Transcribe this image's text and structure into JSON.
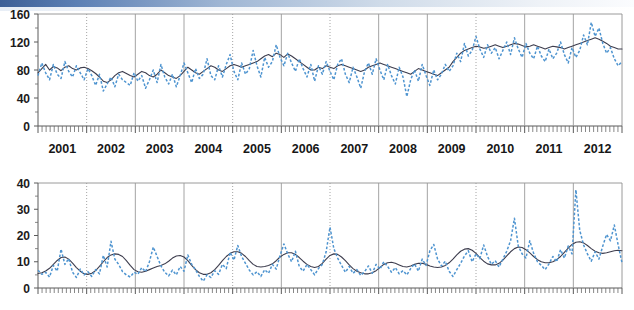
{
  "figure": {
    "title": "",
    "background_color": "#ffffff",
    "panels": 2
  },
  "style": {
    "series_a_color": "#3d3d4e",
    "series_b_color": "#4e94d0",
    "grid_color": "#9a9a9a",
    "axis_color": "#5a5a5a",
    "accent_band": "#3d5f96"
  },
  "chart_data": [
    {
      "type": "line",
      "panel": "top",
      "title": "",
      "xlabel": "",
      "ylabel": "",
      "xlim": [
        2000.5,
        2012.5
      ],
      "ylim": [
        0,
        160
      ],
      "yticks": [
        0,
        40,
        80,
        120,
        160
      ],
      "ytick_labels": [
        "0",
        "40",
        "80",
        "120",
        "160"
      ],
      "xticks": [
        2001,
        2002,
        2003,
        2004,
        2005,
        2006,
        2007,
        2008,
        2009,
        2010,
        2011,
        2012
      ],
      "xtick_labels": [
        "2001",
        "2002",
        "2003",
        "2004",
        "2005",
        "2006",
        "2007",
        "2008",
        "2009",
        "2010",
        "2011",
        "2012"
      ],
      "minor_ticks_per_year": 12,
      "grid": {
        "vertical": true,
        "horizontal": false,
        "dotted_years": [
          2002,
          2005,
          2007,
          2010
        ]
      },
      "legend": {
        "visible": false,
        "position": "none"
      },
      "series": [
        {
          "name": "smoothed",
          "style": "solid",
          "color": "#3d3d4e",
          "values": [
            76,
            82,
            88,
            80,
            85,
            83,
            79,
            84,
            86,
            82,
            80,
            83,
            84,
            82,
            79,
            75,
            70,
            64,
            62,
            66,
            72,
            76,
            78,
            75,
            72,
            70,
            74,
            78,
            76,
            72,
            70,
            74,
            80,
            76,
            72,
            70,
            68,
            72,
            78,
            84,
            80,
            76,
            74,
            78,
            82,
            86,
            84,
            80,
            78,
            82,
            86,
            88,
            86,
            84,
            86,
            88,
            90,
            92,
            96,
            100,
            102,
            99,
            104,
            102,
            98,
            103,
            100,
            96,
            92,
            88,
            84,
            80,
            80,
            84,
            82,
            86,
            84,
            82,
            86,
            88,
            86,
            84,
            82,
            80,
            78,
            80,
            84,
            86,
            88,
            90,
            88,
            86,
            84,
            82,
            80,
            78,
            76,
            74,
            78,
            82,
            80,
            78,
            76,
            74,
            72,
            76,
            80,
            84,
            92,
            98,
            104,
            108,
            110,
            112,
            114,
            113,
            111,
            112,
            114,
            116,
            114,
            112,
            114,
            116,
            118,
            117,
            115,
            113,
            114,
            116,
            114,
            112,
            110,
            112,
            114,
            113,
            112,
            110,
            112,
            114,
            116,
            118,
            120,
            122,
            124,
            126,
            124,
            121,
            118,
            114,
            112,
            110,
            110
          ]
        },
        {
          "name": "observed",
          "style": "dashed",
          "color": "#4e94d0",
          "values": [
            72,
            90,
            76,
            66,
            88,
            74,
            68,
            92,
            78,
            70,
            86,
            76,
            66,
            82,
            72,
            58,
            74,
            50,
            60,
            70,
            56,
            74,
            66,
            62,
            58,
            76,
            64,
            72,
            54,
            66,
            80,
            62,
            88,
            70,
            60,
            74,
            56,
            72,
            90,
            76,
            62,
            82,
            68,
            74,
            96,
            72,
            66,
            86,
            70,
            88,
            102,
            78,
            66,
            90,
            74,
            82,
            108,
            86,
            70,
            98,
            84,
            92,
            116,
            98,
            86,
            104,
            90,
            78,
            96,
            82,
            70,
            88,
            64,
            86,
            74,
            92,
            78,
            66,
            88,
            96,
            74,
            62,
            84,
            70,
            54,
            78,
            90,
            74,
            96,
            80,
            66,
            88,
            72,
            60,
            84,
            70,
            42,
            66,
            80,
            64,
            88,
            72,
            58,
            80,
            66,
            74,
            88,
            78,
            86,
            104,
            92,
            118,
            100,
            108,
            128,
            110,
            98,
            116,
            104,
            112,
            96,
            108,
            120,
            102,
            126,
            110,
            98,
            118,
            104,
            96,
            114,
            100,
            92,
            110,
            96,
            104,
            120,
            102,
            90,
            112,
            98,
            108,
            130,
            116,
            148,
            128,
            140,
            118,
            104,
            112,
            96,
            86,
            92
          ]
        }
      ]
    },
    {
      "type": "line",
      "panel": "bottom",
      "title": "",
      "xlabel": "",
      "ylabel": "",
      "xlim": [
        2000.5,
        2012.5
      ],
      "ylim": [
        0,
        40
      ],
      "yticks": [
        0,
        10,
        20,
        30,
        40
      ],
      "ytick_labels": [
        "0",
        "10",
        "20",
        "30",
        "40"
      ],
      "xticks": [
        2001,
        2002,
        2003,
        2004,
        2005,
        2006,
        2007,
        2008,
        2009,
        2010,
        2011,
        2012
      ],
      "xtick_labels": [
        "2001",
        "2002",
        "2003",
        "2004",
        "2005",
        "2006",
        "2007",
        "2008",
        "2009",
        "2010",
        "2011",
        "2012"
      ],
      "minor_ticks_per_year": 12,
      "grid": {
        "vertical": true,
        "horizontal": false,
        "dotted_years": [
          2002,
          2005,
          2007,
          2010
        ]
      },
      "legend": {
        "visible": false,
        "position": "none"
      },
      "series": [
        {
          "name": "smoothed",
          "style": "solid",
          "color": "#3d3d4e",
          "values": [
            5.5,
            5.8,
            6.5,
            7.5,
            9.0,
            10.5,
            11.6,
            11.8,
            11.0,
            9.5,
            7.8,
            6.4,
            5.4,
            5.2,
            5.6,
            6.6,
            8.2,
            10.0,
            11.6,
            12.6,
            13.0,
            12.8,
            12.0,
            10.4,
            8.6,
            7.0,
            6.2,
            6.0,
            6.4,
            7.0,
            7.6,
            8.2,
            8.6,
            9.2,
            10.2,
            11.4,
            12.2,
            12.4,
            11.8,
            10.4,
            8.6,
            7.0,
            5.8,
            5.2,
            5.2,
            5.8,
            7.0,
            8.6,
            10.4,
            12.0,
            13.2,
            13.8,
            13.8,
            13.2,
            12.0,
            10.4,
            9.0,
            8.2,
            8.0,
            8.2,
            8.6,
            9.2,
            10.4,
            11.8,
            12.8,
            13.4,
            13.4,
            12.8,
            11.6,
            10.2,
            9.0,
            8.2,
            7.8,
            8.2,
            9.4,
            11.0,
            12.4,
            13.0,
            12.8,
            11.8,
            10.4,
            8.8,
            7.4,
            6.4,
            5.8,
            5.4,
            5.4,
            5.8,
            6.6,
            7.8,
            9.0,
            9.6,
            9.8,
            9.4,
            8.8,
            8.2,
            8.0,
            8.4,
            9.0,
            9.4,
            9.4,
            9.0,
            8.4,
            8.0,
            7.8,
            8.0,
            8.6,
            9.6,
            11.0,
            12.6,
            14.0,
            14.8,
            15.0,
            14.4,
            13.2,
            11.6,
            10.2,
            9.2,
            8.8,
            8.8,
            9.4,
            10.6,
            12.2,
            13.8,
            15.0,
            15.6,
            15.4,
            14.6,
            13.4,
            12.0,
            10.8,
            10.0,
            9.6,
            9.6,
            10.0,
            10.8,
            12.0,
            13.6,
            15.2,
            16.6,
            17.4,
            17.6,
            17.2,
            16.2,
            15.0,
            14.0,
            13.4,
            13.2,
            13.4,
            13.8,
            14.2,
            14.4,
            14.2
          ]
        },
        {
          "name": "observed",
          "style": "dashed",
          "color": "#4e94d0",
          "values": [
            6.8,
            5.2,
            6.0,
            4.2,
            8.6,
            6.4,
            14.8,
            9.0,
            11.2,
            6.0,
            4.0,
            7.2,
            5.0,
            6.2,
            4.4,
            7.0,
            5.4,
            12.4,
            8.0,
            17.8,
            11.0,
            9.0,
            6.2,
            5.0,
            4.2,
            6.0,
            5.2,
            7.8,
            6.2,
            10.0,
            15.6,
            12.0,
            8.4,
            6.0,
            4.6,
            6.8,
            5.0,
            8.2,
            6.4,
            12.6,
            9.0,
            7.0,
            4.4,
            2.6,
            5.0,
            4.0,
            6.6,
            5.2,
            9.0,
            7.4,
            13.6,
            10.6,
            16.2,
            12.0,
            9.4,
            6.8,
            5.0,
            6.2,
            4.4,
            7.0,
            5.6,
            9.0,
            7.2,
            12.4,
            16.8,
            13.0,
            10.0,
            14.0,
            8.2,
            6.4,
            9.0,
            7.0,
            5.0,
            7.4,
            9.0,
            13.8,
            23.2,
            15.0,
            11.4,
            8.6,
            6.0,
            8.2,
            5.6,
            7.0,
            4.8,
            6.2,
            8.4,
            5.6,
            9.0,
            7.2,
            10.0,
            8.2,
            6.0,
            7.8,
            5.4,
            6.6,
            5.0,
            7.4,
            9.2,
            6.4,
            11.0,
            8.6,
            14.2,
            16.6,
            11.0,
            8.4,
            10.2,
            6.4,
            4.4,
            7.0,
            9.4,
            12.2,
            14.2,
            10.0,
            13.0,
            11.2,
            16.4,
            12.0,
            9.0,
            10.4,
            8.0,
            11.0,
            14.0,
            18.0,
            26.6,
            16.0,
            13.0,
            11.4,
            18.0,
            13.2,
            10.0,
            8.6,
            7.0,
            9.2,
            12.0,
            10.0,
            14.6,
            11.4,
            16.0,
            13.0,
            37.4,
            22.0,
            16.4,
            13.0,
            10.2,
            13.8,
            11.0,
            16.0,
            20.4,
            18.0,
            24.0,
            16.4,
            9.6
          ]
        }
      ]
    }
  ]
}
